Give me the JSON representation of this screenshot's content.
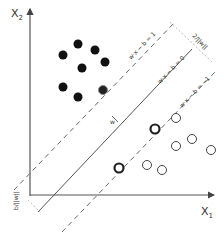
{
  "axes": {
    "x_label": "X",
    "x_sub": "1",
    "y_label": "X",
    "y_sub": "2"
  },
  "lines": {
    "hyperplane": "w·x − b = 0",
    "upper_margin": "w·x − b = 1",
    "lower_margin": "w·x − b = −1",
    "normal_vector": "w"
  },
  "annotations": {
    "margin_width": "2/||w||",
    "offset": "b/||w||"
  },
  "colors": {
    "axis": "#555555",
    "line": "#555555",
    "dash": "#666666",
    "filled_point": "#111111",
    "open_point": "#444444"
  },
  "points": {
    "class_filled": [
      [
        78,
        44
      ],
      [
        95,
        50
      ],
      [
        63,
        55
      ],
      [
        105,
        62
      ],
      [
        82,
        68
      ],
      [
        63,
        87
      ],
      [
        78,
        97
      ]
    ],
    "class_filled_support": [
      [
        103,
        90
      ]
    ],
    "class_open": [
      [
        176,
        118
      ],
      [
        192,
        139
      ],
      [
        176,
        146
      ],
      [
        211,
        150
      ],
      [
        147,
        165
      ],
      [
        162,
        170
      ]
    ],
    "class_open_support": [
      [
        155,
        129
      ],
      [
        119,
        168
      ]
    ]
  }
}
